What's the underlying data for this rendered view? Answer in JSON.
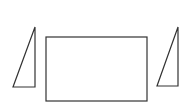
{
  "diagram": {
    "stroke_color": "#333333",
    "background": "#ffffff",
    "shapes": [
      {
        "type": "triangle",
        "name": "left-triangle",
        "points": [
          [
            35,
            27
          ],
          [
            13,
            87
          ],
          [
            35,
            87
          ]
        ]
      },
      {
        "type": "rectangle",
        "name": "center-rectangle",
        "x": 46,
        "y": 37,
        "width": 101,
        "height": 64
      },
      {
        "type": "triangle",
        "name": "right-triangle",
        "points": [
          [
            178,
            27
          ],
          [
            157,
            86
          ],
          [
            178,
            86
          ]
        ]
      }
    ]
  }
}
